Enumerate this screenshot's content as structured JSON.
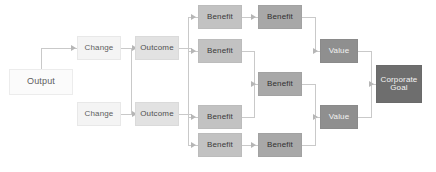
{
  "diagram": {
    "type": "flow-chain",
    "background_color": "#ffffff",
    "connector_color": "#c9c9c9",
    "arrow_color": "#b6b6b6",
    "columns": [
      {
        "key": "output",
        "label": "Output",
        "fill": "#fbfbfb",
        "text_color": "#5e5e5e"
      },
      {
        "key": "change",
        "label": "Change",
        "fill": "#f4f4f4",
        "text_color": "#5e5e5e"
      },
      {
        "key": "outcome",
        "label": "Outcome",
        "fill": "#e2e2e2",
        "text_color": "#4f4f4f"
      },
      {
        "key": "benefit1",
        "label": "Benefit",
        "fill": "#c2c2c2",
        "text_color": "#3a3a3a"
      },
      {
        "key": "benefit2",
        "label": "Benefit",
        "fill": "#a8a8a8",
        "text_color": "#303030"
      },
      {
        "key": "value",
        "label": "Value",
        "fill": "#8f8f8f",
        "text_color": "#f2f2f2"
      },
      {
        "key": "goal",
        "label": "Corporate Goal",
        "fill": "#6e6e6e",
        "text_color": "#f4f4f4"
      }
    ],
    "nodes": {
      "output": {
        "label": "Output"
      },
      "change_a": {
        "label": "Change"
      },
      "change_b": {
        "label": "Change"
      },
      "outcome_a": {
        "label": "Outcome"
      },
      "outcome_b": {
        "label": "Outcome"
      },
      "benefit_a1": {
        "label": "Benefit"
      },
      "benefit_a2": {
        "label": "Benefit"
      },
      "benefit_a3": {
        "label": "Benefit"
      },
      "benefit_a4": {
        "label": "Benefit"
      },
      "benefit_b1": {
        "label": "Benefit"
      },
      "benefit_b2": {
        "label": "Benefit"
      },
      "benefit_b3": {
        "label": "Benefit"
      },
      "value_top": {
        "label": "Value"
      },
      "value_bottom": {
        "label": "Value"
      },
      "goal": {
        "label": "Corporate\nGoal",
        "line1": "Corporate",
        "line2": "Goal"
      }
    }
  }
}
